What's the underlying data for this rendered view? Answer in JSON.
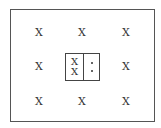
{
  "diagram": {
    "outer_marks": [
      {
        "label": "X",
        "x": 39,
        "y": 32
      },
      {
        "label": "X",
        "x": 82,
        "y": 32
      },
      {
        "label": "X",
        "x": 126,
        "y": 32
      },
      {
        "label": "X",
        "x": 39,
        "y": 66
      },
      {
        "label": "X",
        "x": 126,
        "y": 66
      },
      {
        "label": "X",
        "x": 39,
        "y": 101
      },
      {
        "label": "X",
        "x": 82,
        "y": 101
      },
      {
        "label": "X",
        "x": 126,
        "y": 101
      }
    ],
    "center_box": {
      "left_marks": [
        "X",
        "X"
      ],
      "right_marks": [
        "•",
        "•"
      ]
    }
  }
}
